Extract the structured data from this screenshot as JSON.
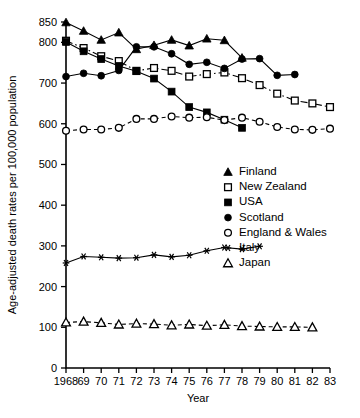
{
  "chart_data": {
    "type": "line",
    "title": "",
    "xlabel": "Year",
    "ylabel": "Age-adjusted death rates per 100,000 population",
    "xlim": [
      1968,
      1983
    ],
    "ylim": [
      0,
      850
    ],
    "yticks": [
      0,
      100,
      200,
      300,
      400,
      500,
      600,
      700,
      800,
      850
    ],
    "ytick_labels": [
      "0",
      "100",
      "200",
      "300",
      "400",
      "500",
      "600",
      "700",
      "800",
      "850"
    ],
    "xticks": [
      1968,
      1969,
      1970,
      1971,
      1972,
      1973,
      1974,
      1975,
      1976,
      1977,
      1978,
      1979,
      1980,
      1981,
      1982,
      1983
    ],
    "xtick_labels": [
      "1968",
      "69",
      "70",
      "71",
      "72",
      "73",
      "74",
      "75",
      "76",
      "77",
      "78",
      "79",
      "80",
      "81",
      "82",
      "83"
    ],
    "grid": false,
    "legend_position": "center-right",
    "series": [
      {
        "name": "Finland",
        "marker": "filled-triangle",
        "linestyle": "solid",
        "x": [
          1968,
          1969,
          1970,
          1971,
          1972,
          1973,
          1974,
          1975,
          1976,
          1977,
          1978
        ],
        "values": [
          849,
          828,
          806,
          824,
          783,
          793,
          806,
          792,
          809,
          805,
          762
        ]
      },
      {
        "name": "New Zealand",
        "marker": "open-square",
        "linestyle": "dash-dot",
        "x": [
          1968,
          1969,
          1970,
          1971,
          1972,
          1973,
          1974,
          1975,
          1976,
          1977,
          1978,
          1979,
          1980,
          1981,
          1982,
          1983
        ],
        "values": [
          804,
          786,
          766,
          754,
          730,
          737,
          730,
          716,
          722,
          726,
          712,
          695,
          674,
          657,
          650,
          641
        ]
      },
      {
        "name": "USA",
        "marker": "filled-square",
        "linestyle": "solid",
        "x": [
          1968,
          1969,
          1970,
          1971,
          1972,
          1973,
          1974,
          1975,
          1976,
          1977,
          1978
        ],
        "values": [
          801,
          778,
          759,
          742,
          729,
          711,
          679,
          641,
          628,
          610,
          590
        ]
      },
      {
        "name": "Scotland",
        "marker": "filled-circle",
        "linestyle": "solid",
        "x": [
          1968,
          1969,
          1970,
          1971,
          1972,
          1973,
          1974,
          1975,
          1976,
          1977,
          1978,
          1979,
          1980,
          1981
        ],
        "values": [
          716,
          724,
          718,
          731,
          789,
          789,
          772,
          746,
          751,
          736,
          759,
          760,
          719,
          721
        ]
      },
      {
        "name": "England & Wales",
        "marker": "open-circle",
        "linestyle": "dashed",
        "x": [
          1968,
          1969,
          1970,
          1971,
          1972,
          1973,
          1974,
          1975,
          1976,
          1977,
          1978,
          1979,
          1980,
          1981,
          1982,
          1983
        ],
        "values": [
          583,
          586,
          586,
          590,
          612,
          612,
          618,
          615,
          616,
          609,
          615,
          605,
          592,
          586,
          585,
          588
        ]
      },
      {
        "name": "Italy",
        "marker": "asterisk",
        "linestyle": "solid",
        "x": [
          1968,
          1969,
          1970,
          1971,
          1972,
          1973,
          1974,
          1975,
          1976,
          1977,
          1978,
          1979
        ],
        "values": [
          258,
          274,
          272,
          270,
          271,
          278,
          273,
          277,
          288,
          296,
          292,
          299
        ]
      },
      {
        "name": "Japan",
        "marker": "open-triangle",
        "linestyle": "dashed",
        "x": [
          1968,
          1969,
          1970,
          1971,
          1972,
          1973,
          1974,
          1975,
          1976,
          1977,
          1978,
          1979,
          1980,
          1981,
          1982
        ],
        "values": [
          112,
          114,
          111,
          107,
          109,
          108,
          105,
          107,
          104,
          106,
          103,
          102,
          101,
          101,
          100
        ]
      }
    ]
  },
  "legend": {
    "items": [
      {
        "label": "Finland",
        "marker": "filled-triangle"
      },
      {
        "label": "New Zealand",
        "marker": "open-square"
      },
      {
        "label": "USA",
        "marker": "filled-square"
      },
      {
        "label": "Scotland",
        "marker": "filled-circle"
      },
      {
        "label": "England & Wales",
        "marker": "open-circle"
      },
      {
        "label": "Italy",
        "marker": "asterisk"
      },
      {
        "label": "Japan",
        "marker": "open-triangle"
      }
    ]
  }
}
